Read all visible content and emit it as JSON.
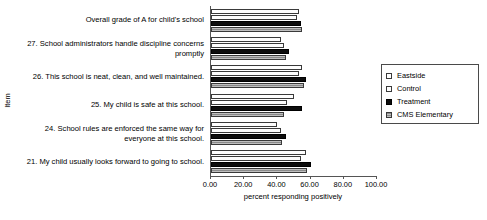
{
  "chart_data": {
    "type": "bar",
    "orientation": "horizontal",
    "title": "",
    "xlabel": "percent responding positively",
    "ylabel": "Item",
    "xlim": [
      0,
      100
    ],
    "xticks": [
      "0.00",
      "20.00",
      "40.00",
      "60.00",
      "80.00",
      "100.00"
    ],
    "grid": false,
    "legend_position": "right",
    "categories": [
      "Overall grade of A for child's school",
      "27. School administrators handle discipline concerns promptly",
      "26. This school is neat, clean, and well maintained.",
      "25. My child is safe at this school.",
      "24. School rules are enforced the same way for everyone at this school.",
      "21. My child usually looks forward to going to school."
    ],
    "series": [
      {
        "name": "Eastside",
        "color": "#fefefe",
        "values": [
          53.0,
          42.0,
          55.0,
          50.0,
          40.0,
          57.0
        ]
      },
      {
        "name": "Control",
        "color": "#fdfdfd",
        "values": [
          52.0,
          44.0,
          53.0,
          46.0,
          42.0,
          54.0
        ]
      },
      {
        "name": "Treatment",
        "color": "#0d0d0d",
        "values": [
          54.0,
          47.0,
          57.0,
          55.0,
          45.0,
          60.0
        ]
      },
      {
        "name": "CMS Elementary",
        "color": "#8a8a8a",
        "values": [
          55.0,
          45.0,
          56.0,
          44.0,
          43.0,
          58.0
        ]
      }
    ]
  },
  "legend": {
    "items": [
      {
        "label": "Eastside"
      },
      {
        "label": "Control"
      },
      {
        "label": "Treatment"
      },
      {
        "label": "CMS Elementary"
      }
    ]
  }
}
